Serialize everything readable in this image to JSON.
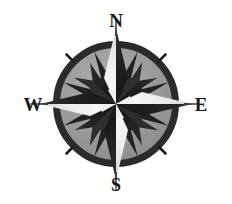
{
  "figure": {
    "name": "compass-rose",
    "background_color": "#ffffff",
    "width": 232,
    "height": 204
  },
  "labels": {
    "north": "N",
    "east": "E",
    "south": "S",
    "west": "W"
  },
  "colors": {
    "ring_dark": "#2b2b2b",
    "disc_gray": "#9c9c9c",
    "point_dark": "#1f1f1f",
    "point_light": "#f2f2f2",
    "point_mid": "#c9c9c9",
    "label_text": "#1a1a1a",
    "background": "#ffffff"
  },
  "geometry": {
    "center_x": 116,
    "center_y": 104,
    "ring_outer_radius": 63,
    "ring_inner_radius": 56,
    "ring_stroke_width": 6,
    "cardinal_point_length": 80,
    "ordinal_point_length": 54,
    "secondary_ray_length": 56,
    "hub_radius": 9,
    "point_count": 8
  },
  "star_points": [
    {
      "name": "north",
      "angle_deg": 0,
      "kind": "cardinal",
      "label": "N"
    },
    {
      "name": "northeast",
      "angle_deg": 45,
      "kind": "ordinal",
      "label": ""
    },
    {
      "name": "east",
      "angle_deg": 90,
      "kind": "cardinal",
      "label": "E"
    },
    {
      "name": "southeast",
      "angle_deg": 135,
      "kind": "ordinal",
      "label": ""
    },
    {
      "name": "south",
      "angle_deg": 180,
      "kind": "cardinal",
      "label": "S"
    },
    {
      "name": "southwest",
      "angle_deg": 225,
      "kind": "ordinal",
      "label": ""
    },
    {
      "name": "west",
      "angle_deg": 270,
      "kind": "cardinal",
      "label": "W"
    },
    {
      "name": "northwest",
      "angle_deg": 315,
      "kind": "ordinal",
      "label": ""
    }
  ],
  "tick_marks": {
    "count": 4,
    "positions_deg": [
      45,
      135,
      225,
      315
    ]
  }
}
